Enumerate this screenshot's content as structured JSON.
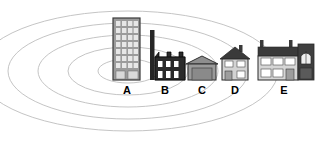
{
  "diagram": {
    "background_color": "#ffffff",
    "ring_color": "#b9b9b9",
    "contours": {
      "count": 5,
      "center_x": 128,
      "center_y": 71,
      "radii_x": [
        30,
        60,
        90,
        120,
        150
      ],
      "radii_y": [
        12,
        24,
        36,
        48,
        60
      ]
    },
    "buildings": [
      {
        "id": "A",
        "label": "A",
        "type": "tower-block",
        "description": "Tall multi-storey office tower with grid of windows",
        "fill": "#9b9b9b",
        "outline": "#3a3a3a",
        "window_fill": "#e2e2e2",
        "floors": 8,
        "columns": 4,
        "x": 113,
        "y": 18,
        "width": 27,
        "height": 62,
        "label_x": 117,
        "label_y": 82
      },
      {
        "id": "B",
        "label": "B",
        "type": "factory",
        "description": "Dark factory with tall chimney and sawtooth roof",
        "fill": "#2b2b2b",
        "outline": "#000000",
        "window_fill": "#ffffff",
        "x": 148,
        "y": 40,
        "width": 37,
        "height": 40,
        "label_x": 157,
        "label_y": 82
      },
      {
        "id": "C",
        "label": "C",
        "type": "warehouse",
        "description": "Grey warehouse with pitched roof and wide door",
        "fill": "#8e8e8e",
        "outline": "#2f2f2f",
        "door_fill": "#8a8a8a",
        "x": 187,
        "y": 57,
        "width": 31,
        "height": 23,
        "label_x": 194,
        "label_y": 82
      },
      {
        "id": "D",
        "label": "D",
        "type": "detached-house",
        "description": "Detached two-storey house with dark gable roof and chimney",
        "roof_fill": "#3a3a3a",
        "wall_fill": "#d3d3d3",
        "outline": "#2a2a2a",
        "window_fill": "#ffffff",
        "x": 220,
        "y": 45,
        "width": 32,
        "height": 35,
        "label_x": 228,
        "label_y": 82
      },
      {
        "id": "E",
        "label": "E",
        "type": "terraced-houses",
        "description": "Wide terrace of houses, two chimneys, darker right wing with arched window",
        "roof_fill": "#3a3a3a",
        "wall_fill": "#d6d6d6",
        "dark_wing_fill": "#3f3f3f",
        "outline": "#2a2a2a",
        "window_fill": "#ffffff",
        "x": 258,
        "y": 41,
        "width": 56,
        "height": 39,
        "label_x": 277,
        "label_y": 82
      }
    ]
  }
}
